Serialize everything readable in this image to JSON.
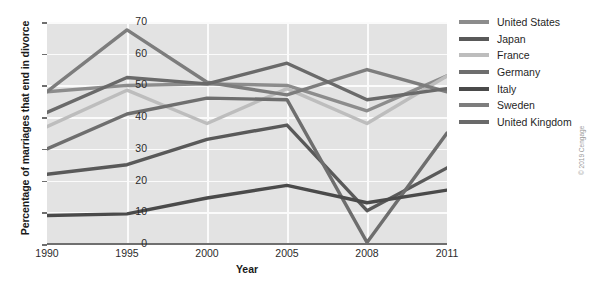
{
  "chart_data": {
    "type": "line",
    "title": "",
    "xlabel": "Year",
    "ylabel": "Percentage of marriages that end in divorce",
    "categories": [
      "1990",
      "1995",
      "2000",
      "2005",
      "2008",
      "2011"
    ],
    "x_tick_labels": [
      "1990",
      "1995",
      "2000",
      "2005",
      "2008",
      "2011"
    ],
    "y_tick_labels": [
      "0",
      "10",
      "20",
      "30",
      "40",
      "50",
      "60",
      "70"
    ],
    "ylim": [
      0,
      70
    ],
    "y_step": 10,
    "grid": true,
    "legend_position": "right",
    "plot_background": "#e3e3e3",
    "gridline_color": "#fbfbfb",
    "series": [
      {
        "name": "United States",
        "color": "#8c8c8c",
        "values": [
          48,
          50,
          50.5,
          50,
          42,
          53
        ]
      },
      {
        "name": "Japan",
        "color": "#595959",
        "values": [
          22,
          25,
          33,
          37.5,
          10.5,
          24
        ]
      },
      {
        "name": "France",
        "color": "#bdbdbd",
        "values": [
          37,
          48.5,
          38,
          49,
          38,
          53
        ]
      },
      {
        "name": "Germany",
        "color": "#6e6e6e",
        "values": [
          30,
          41,
          46,
          45.5,
          0.5,
          35
        ]
      },
      {
        "name": "Italy",
        "color": "#4a4a4a",
        "values": [
          9,
          9.5,
          14.5,
          18.5,
          13,
          17
        ]
      },
      {
        "name": "Sweden",
        "color": "#7d7d7d",
        "values": [
          48,
          67.5,
          51,
          47,
          55,
          48
        ]
      },
      {
        "name": "United Kingdom",
        "color": "#6a6a6a",
        "values": [
          41.5,
          52.5,
          50.5,
          57,
          45.5,
          49
        ]
      }
    ]
  },
  "legend": {
    "items": [
      {
        "label": "United States",
        "color": "#8c8c8c"
      },
      {
        "label": "Japan",
        "color": "#595959"
      },
      {
        "label": "France",
        "color": "#bdbdbd"
      },
      {
        "label": "Germany",
        "color": "#6e6e6e"
      },
      {
        "label": "Italy",
        "color": "#4a4a4a"
      },
      {
        "label": "Sweden",
        "color": "#7d7d7d"
      },
      {
        "label": "United Kingdom",
        "color": "#6a6a6a"
      }
    ]
  },
  "credit": {
    "text": "© 2019 Cengage"
  }
}
